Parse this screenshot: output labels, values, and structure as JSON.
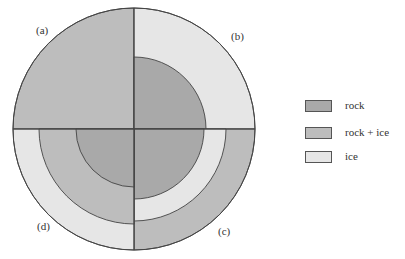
{
  "colors": {
    "rock": "#a9a9a9",
    "rock_ice": "#bdbdbd",
    "ice": "#e6e6e6",
    "stroke": "#444444"
  },
  "quadrant_labels": {
    "a": "(a)",
    "b": "(b)",
    "c": "(c)",
    "d": "(d)"
  },
  "legend": {
    "items": [
      {
        "label": "rock",
        "key": "rock"
      },
      {
        "label": "rock + ice",
        "key": "rock_ice"
      },
      {
        "label": "ice",
        "key": "ice"
      }
    ]
  },
  "models": {
    "a": {
      "layers": [
        {
          "material": "rock_ice",
          "outer_radius": 121
        }
      ]
    },
    "b": {
      "layers": [
        {
          "material": "rock",
          "outer_radius": 72
        },
        {
          "material": "ice",
          "outer_radius": 121
        }
      ]
    },
    "c": {
      "layers": [
        {
          "material": "rock",
          "outer_radius": 70
        },
        {
          "material": "ice",
          "outer_radius": 92
        },
        {
          "material": "rock_ice",
          "outer_radius": 121
        }
      ]
    },
    "d": {
      "layers": [
        {
          "material": "rock",
          "outer_radius": 58
        },
        {
          "material": "rock_ice",
          "outer_radius": 95
        },
        {
          "material": "ice",
          "outer_radius": 121
        }
      ]
    }
  }
}
